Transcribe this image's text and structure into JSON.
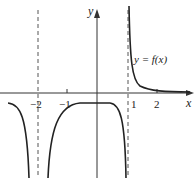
{
  "diagram": {
    "type": "function-graph",
    "curve_label": "y = f(x)",
    "axes": {
      "x_label": "x",
      "y_label": "y"
    },
    "ticks": {
      "x": [
        "−2",
        "−1",
        "1",
        "2"
      ]
    },
    "vertical_asymptotes": [
      -2,
      1
    ],
    "horizontal_asymptote": 0,
    "colors": {
      "curve": "#222222",
      "axis": "#333333",
      "dashed": "#555555",
      "background": "#ffffff"
    }
  }
}
